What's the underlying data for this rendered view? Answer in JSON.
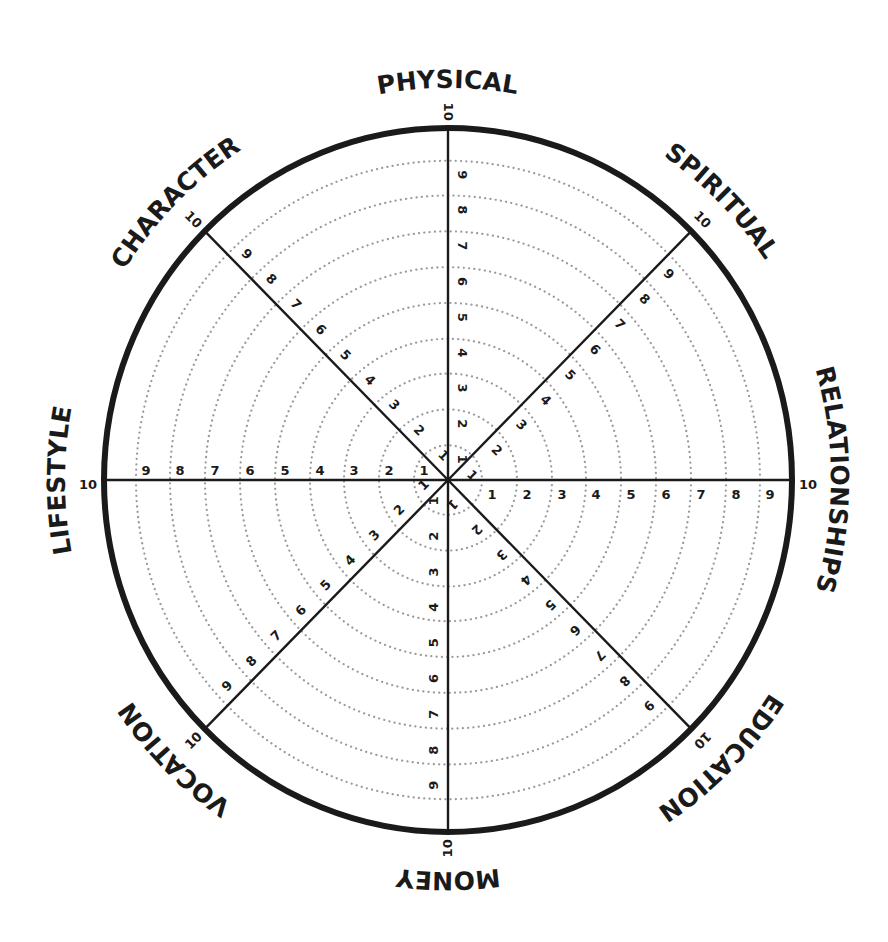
{
  "title": "Wheel of Life",
  "colors": {
    "ink": "#1a1a1a",
    "ring_dots": "#9a9a9a",
    "background": "#ffffff"
  },
  "wheel": {
    "center": [
      448,
      480
    ],
    "outer_rx": 344,
    "outer_ry": 352,
    "ring_radii": [
      34,
      69,
      104,
      138,
      173,
      208,
      243,
      278,
      312
    ],
    "scale_labels": [
      "1",
      "2",
      "3",
      "4",
      "5",
      "6",
      "7",
      "8",
      "9",
      "10"
    ]
  },
  "categories": [
    {
      "name": "PHYSICAL",
      "angle": -90
    },
    {
      "name": "SPIRITUAL",
      "angle": -45
    },
    {
      "name": "RELATIONSHIPS",
      "angle": 0
    },
    {
      "name": "EDUCATION",
      "angle": 45
    },
    {
      "name": "MONEY",
      "angle": 90
    },
    {
      "name": "VOCATION",
      "angle": 135
    },
    {
      "name": "LIFESTYLE",
      "angle": 180
    },
    {
      "name": "CHARACTER",
      "angle": -135
    }
  ]
}
